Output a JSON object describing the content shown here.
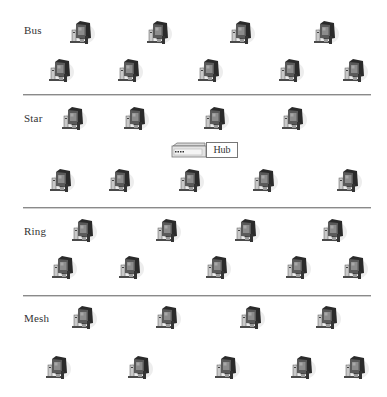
{
  "diagram": {
    "type": "network-topologies",
    "sections": [
      {
        "name": "Bus",
        "label_pos": {
          "x": 24,
          "y": 31
        },
        "rows": [
          {
            "y": 20,
            "xs": [
              66,
              143,
              226,
              310
            ]
          },
          {
            "y": 58,
            "xs": [
              45,
              114,
              194,
              275,
              339
            ]
          }
        ]
      },
      {
        "name": "Star",
        "label_pos": {
          "x": 24,
          "y": 119
        },
        "rows": [
          {
            "y": 106,
            "xs": [
              58,
              120,
              200,
              278
            ]
          },
          {
            "y": 168,
            "xs": [
              46,
              105,
              175,
              249,
              333
            ]
          }
        ],
        "hub": {
          "label": "Hub"
        }
      },
      {
        "name": "Ring",
        "label_pos": {
          "x": 24,
          "y": 232
        },
        "rows": [
          {
            "y": 218,
            "xs": [
              68,
              152,
              231,
              318
            ]
          },
          {
            "y": 255,
            "xs": [
              48,
              115,
              202,
              282,
              339
            ]
          }
        ]
      },
      {
        "name": "Mesh",
        "label_pos": {
          "x": 24,
          "y": 319
        },
        "rows": [
          {
            "y": 305,
            "xs": [
              68,
              152,
              236,
              312
            ]
          },
          {
            "y": 355,
            "xs": [
              42,
              124,
              211,
              287,
              340
            ]
          }
        ]
      }
    ],
    "dividers_y": [
      94,
      207,
      295
    ],
    "icon": "desktop-computer-icon",
    "colors": {
      "divider": "#8a8a8a",
      "text": "#333333",
      "monitor_dark": "#2a2a2a",
      "monitor_screen": "#8c8c8c"
    }
  },
  "labels": {
    "bus": "Bus",
    "star": "Star",
    "ring": "Ring",
    "mesh": "Mesh",
    "hub": "Hub"
  }
}
